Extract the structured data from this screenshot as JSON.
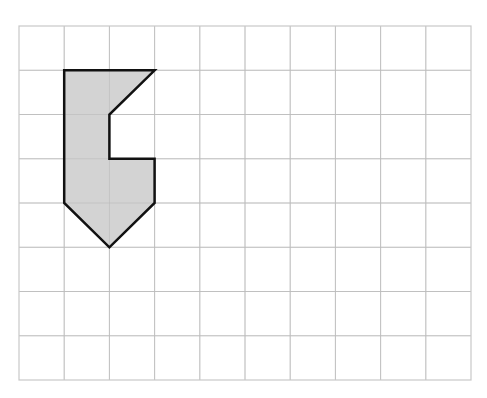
{
  "diagram": {
    "type": "grid-shape",
    "grid": {
      "columns": 10,
      "rows": 8,
      "origin_x": 19,
      "origin_y": 26,
      "cell_width": 45.2,
      "cell_height": 44.25,
      "line_color": "#cccccc",
      "border_color": "#c8c8c8"
    },
    "shape": {
      "vertices_grid": [
        [
          1,
          1
        ],
        [
          3,
          1
        ],
        [
          2,
          2
        ],
        [
          2,
          3
        ],
        [
          3,
          3
        ],
        [
          3,
          4
        ],
        [
          2,
          5
        ],
        [
          1,
          4
        ]
      ],
      "fill": "#d3d3d3",
      "stroke": "#111111",
      "stroke_width": 2.5
    }
  }
}
